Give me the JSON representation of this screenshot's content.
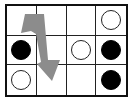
{
  "puzzle": {
    "rows": 3,
    "cols": 4,
    "cells": [
      [
        "empty",
        "empty",
        "empty",
        "white"
      ],
      [
        "black",
        "empty",
        "white",
        "black"
      ],
      [
        "white",
        "empty",
        "empty",
        "black"
      ]
    ]
  },
  "arrow": {
    "color": "#8c8c8c",
    "direction": "down",
    "description": "bent arrow from top-left cell region pointing down into column 2, row 3"
  },
  "colors": {
    "grid": "#111111",
    "white_piece": "#ffffff",
    "black_piece": "#000000"
  }
}
